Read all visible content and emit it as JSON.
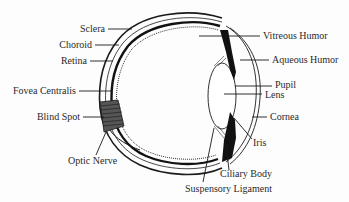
{
  "diagram": {
    "colors": {
      "ink": "#1a1a1a",
      "text": "#2a2a2a",
      "background": "#fdfdfd"
    },
    "labels_left": [
      {
        "id": "sclera",
        "text": "Sclera"
      },
      {
        "id": "choroid",
        "text": "Choroid"
      },
      {
        "id": "retina",
        "text": "Retina"
      },
      {
        "id": "fovea-centralis",
        "text": "Fovea Centralis"
      },
      {
        "id": "blind-spot",
        "text": "Blind Spot"
      }
    ],
    "labels_bottom_left": [
      {
        "id": "optic-nerve",
        "text": "Optic Nerve"
      }
    ],
    "labels_right": [
      {
        "id": "vitreous-humor",
        "text": "Vitreous Humor"
      },
      {
        "id": "aqueous-humor",
        "text": "Aqueous Humor"
      },
      {
        "id": "pupil",
        "text": "Pupil"
      },
      {
        "id": "lens",
        "text": "Lens"
      },
      {
        "id": "cornea",
        "text": "Cornea"
      },
      {
        "id": "iris",
        "text": "Iris"
      }
    ],
    "labels_bottom_right": [
      {
        "id": "ciliary-body",
        "text": "Ciliary Body"
      },
      {
        "id": "suspensory-ligament",
        "text": "Suspensory Ligament"
      }
    ]
  }
}
